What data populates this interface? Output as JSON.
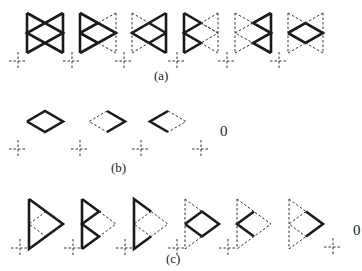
{
  "figure": {
    "panels": [
      {
        "id": "a",
        "label": "(a)",
        "label_pos": [
          154,
          80
        ],
        "trailing_text": null,
        "crosses": [
          [
            18,
            61
          ],
          [
            72,
            61
          ],
          [
            124,
            61
          ],
          [
            177,
            61
          ],
          [
            227,
            61
          ],
          [
            279,
            61
          ]
        ],
        "shapes": [
          {
            "type": "double-bowtie",
            "x": 27,
            "w": 36,
            "solid": [
              "left-tri-top",
              "left-tri-bot",
              "right-tri-top",
              "right-tri-bot"
            ],
            "dashed": []
          },
          {
            "type": "double-bowtie",
            "x": 80,
            "w": 36,
            "solid": [
              "left-tri-top",
              "left-tri-bot"
            ],
            "dashed": [
              "right-tri-top",
              "right-tri-bot"
            ]
          },
          {
            "type": "double-bowtie",
            "x": 132,
            "w": 34,
            "solid": [
              "right-tri-top",
              "right-tri-bot"
            ],
            "dashed": [
              "left-tri-top",
              "left-tri-bot"
            ]
          },
          {
            "type": "double-bowtie",
            "x": 184,
            "w": 34,
            "solid": [
              "left-v-top",
              "left-v-bot"
            ],
            "dashed": [
              "right-half"
            ]
          },
          {
            "type": "double-bowtie",
            "x": 235,
            "w": 36,
            "solid": [
              "right-v-top",
              "right-v-bot"
            ],
            "dashed": [
              "left-half"
            ]
          },
          {
            "type": "double-bowtie",
            "x": 288,
            "w": 35,
            "solid": [
              "center-diamond"
            ],
            "dashed": [
              "outer"
            ]
          }
        ]
      },
      {
        "id": "b",
        "label": "(b)",
        "label_pos": [
          111,
          172
        ],
        "trailing_text": "0",
        "trailing_pos": [
          220,
          136
        ],
        "crosses": [
          [
            18,
            149
          ],
          [
            80,
            149
          ],
          [
            141,
            149
          ],
          [
            201,
            149
          ]
        ],
        "shapes": [
          {
            "type": "diamond",
            "x": 27,
            "w": 36,
            "solid": [
              "all"
            ],
            "dashed": []
          },
          {
            "type": "diamond",
            "x": 89,
            "w": 36,
            "solid": [
              "right"
            ],
            "dashed": [
              "left"
            ]
          },
          {
            "type": "diamond",
            "x": 150,
            "w": 36,
            "solid": [
              "left"
            ],
            "dashed": [
              "right"
            ]
          }
        ]
      },
      {
        "id": "c",
        "label": "(c)",
        "label_pos": [
          166,
          263
        ],
        "trailing_text": "0",
        "trailing_pos": [
          353,
          235
        ],
        "crosses": [
          [
            20,
            248
          ],
          [
            73,
            248
          ],
          [
            125,
            248
          ],
          [
            177,
            248
          ],
          [
            228,
            248
          ],
          [
            333,
            247
          ]
        ],
        "shapes": [
          {
            "type": "triangle",
            "x": 29,
            "w": 34,
            "solid": [
              "outer"
            ],
            "dashed": [
              "inner-v"
            ]
          },
          {
            "type": "triangle",
            "x": 82,
            "w": 34,
            "solid": [
              "left-edge",
              "upper-v",
              "lower-v"
            ],
            "dashed": [
              "right-half"
            ]
          },
          {
            "type": "triangle",
            "x": 134,
            "w": 34,
            "solid": [
              "left-edge",
              "top-edge-part",
              "bottom-edge-part"
            ],
            "dashed": [
              "right-tip"
            ]
          },
          {
            "type": "triangle",
            "x": 185,
            "w": 34,
            "solid": [
              "center-diamond"
            ],
            "dashed": [
              "outer"
            ]
          },
          {
            "type": "triangle",
            "x": 237,
            "w": 34,
            "solid": [
              "left-v"
            ],
            "dashed": [
              "outer"
            ]
          },
          {
            "type": "triangle",
            "x": 289,
            "w": 34,
            "solid": [
              "right-tip"
            ],
            "dashed": [
              "outer",
              "inner-v"
            ]
          }
        ]
      }
    ]
  }
}
